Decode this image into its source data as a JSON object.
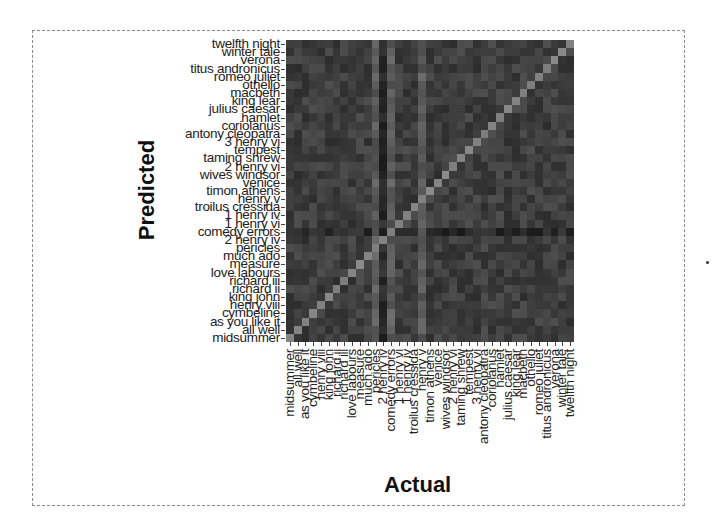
{
  "chart_data": {
    "type": "heatmap",
    "title": "",
    "xlabel": "Actual",
    "ylabel": "Predicted",
    "y_categories_top_to_bottom": [
      "twelfth night",
      "winter tale",
      "verona",
      "titus andronicus",
      "romeo juliet",
      "othello",
      "macbeth",
      "king lear",
      "julius caesar",
      "hamlet",
      "coriolanus",
      "antony cleopatra",
      "3 henry vi",
      "tempest",
      "taming shrew",
      "2 henry vi",
      "wives windsor",
      "venice",
      "timon athens",
      "henry v",
      "troilus cressida",
      "1 henry iv",
      "1 henry vi",
      "comedy errors",
      "2 henry iv",
      "pericles",
      "much ado",
      "measure",
      "love labours",
      "richard iii",
      "richard ii",
      "king john",
      "henry viii",
      "cymbeline",
      "as you like it",
      "all well",
      "midsummer"
    ],
    "x_categories_left_to_right": [
      "midsummer",
      "all well",
      "as you like it",
      "cymbeline",
      "henry viii",
      "king john",
      "richard ii",
      "richard iii",
      "love labours",
      "measure",
      "much ado",
      "pericles",
      "2 henry iv",
      "comedy errors",
      "1 henry vi",
      "1 henry iv",
      "troilus cressida",
      "henry v",
      "timon athens",
      "venice",
      "wives windsor",
      "2 henry vi",
      "taming shrew",
      "tempest",
      "3 henry vi",
      "antony cleopatra",
      "coriolanus",
      "hamlet",
      "julius caesar",
      "king lear",
      "macbeth",
      "othello",
      "romeo juliet",
      "titus andronicus",
      "verona",
      "winter tale",
      "twelfth night"
    ],
    "colormap": "grayscale (darker = lower, lighter = higher)",
    "diagonal": "lighter cells along anti-diagonal from bottom-left to top-right (correct predictions)",
    "highlight_columns": [
      11,
      13,
      17
    ],
    "highlight_rows": [
      23
    ],
    "grid": false,
    "legend": "none"
  },
  "axes": {
    "x_title": "Actual",
    "y_title": "Predicted"
  }
}
